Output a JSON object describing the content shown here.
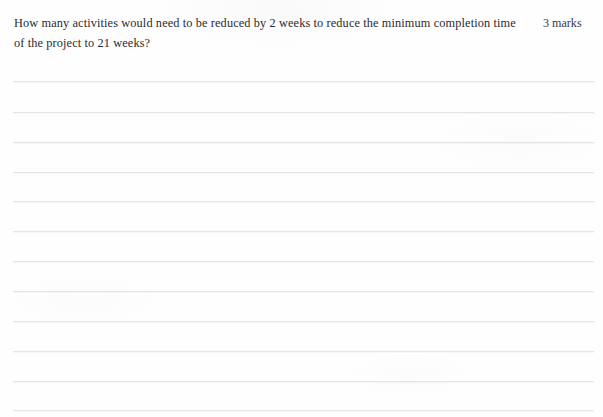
{
  "page": {
    "width": 603,
    "height": 417,
    "background_color": "#fefefe",
    "rule_line_color": "#e6e6e9",
    "text_color": "#2b2b2f"
  },
  "question": {
    "text": "How many activities would need to be reduced by 2 weeks to reduce the minimum completion time of the project to 21 weeks?",
    "marks_label": "3 marks",
    "marks_value": 3
  },
  "answer_area": {
    "line_count": 12,
    "first_line_y": 81,
    "line_spacing": 30.5,
    "line_left": 13,
    "line_width": 581,
    "lines": [
      {
        "index": 1,
        "y": 81,
        "faint": false
      },
      {
        "index": 2,
        "y": 112,
        "faint": false
      },
      {
        "index": 3,
        "y": 142,
        "faint": false
      },
      {
        "index": 4,
        "y": 172,
        "faint": false
      },
      {
        "index": 5,
        "y": 201,
        "faint": false
      },
      {
        "index": 6,
        "y": 231,
        "faint": false
      },
      {
        "index": 7,
        "y": 261,
        "faint": false
      },
      {
        "index": 8,
        "y": 291,
        "faint": false
      },
      {
        "index": 9,
        "y": 321,
        "faint": false
      },
      {
        "index": 10,
        "y": 351,
        "faint": false
      },
      {
        "index": 11,
        "y": 381,
        "faint": false
      },
      {
        "index": 12,
        "y": 410,
        "faint": false
      }
    ]
  }
}
